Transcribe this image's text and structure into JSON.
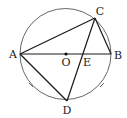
{
  "diagram": {
    "type": "geometry-circle",
    "circle": {
      "center": "O",
      "cx": 65.5,
      "cy": 54,
      "r": 45.5,
      "stroke": "#555555"
    },
    "points": {
      "A": {
        "x": 20,
        "y": 54,
        "label": "A",
        "lx": 13,
        "ly": 58
      },
      "B": {
        "x": 111,
        "y": 54,
        "label": "B",
        "lx": 117,
        "ly": 59
      },
      "C": {
        "x": 95,
        "y": 18,
        "label": "C",
        "lx": 99,
        "ly": 15
      },
      "O": {
        "x": 66,
        "y": 54,
        "label": "O",
        "lx": 66,
        "ly": 66
      },
      "E": {
        "x": 83,
        "y": 54,
        "label": "E",
        "lx": 87,
        "ly": 66
      },
      "D": {
        "x": 67,
        "y": 101,
        "label": "D",
        "lx": 67,
        "ly": 114
      }
    },
    "segments": [
      {
        "name": "AB",
        "from": "A",
        "to": "B"
      },
      {
        "name": "AC",
        "from": "A",
        "to": "C"
      },
      {
        "name": "BC",
        "from": "B",
        "to": "C"
      },
      {
        "name": "CD",
        "from": "C",
        "to": "D"
      },
      {
        "name": "AD",
        "from": "A",
        "to": "D"
      }
    ],
    "equal_arc_marks": [
      {
        "arc": "AD",
        "x": 31,
        "y": 85
      },
      {
        "arc": "BD",
        "x": 102,
        "y": 85
      }
    ],
    "line_color": "#1a1a1a"
  },
  "labels": {
    "A": "A",
    "B": "B",
    "C": "C",
    "O": "O",
    "E": "E",
    "D": "D"
  }
}
